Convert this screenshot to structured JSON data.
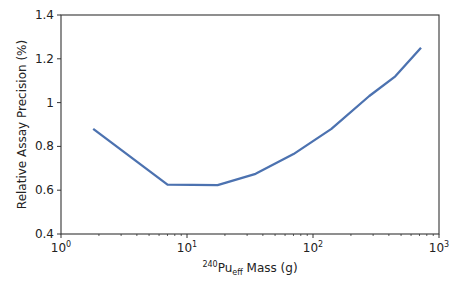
{
  "chart_data": {
    "type": "line",
    "title": "",
    "xlabel": "240Pu_eff Mass (g)",
    "xlabel_parts": {
      "sup": "240",
      "base": "Pu",
      "sub": "eff",
      "rest": " Mass (g)"
    },
    "ylabel": "Relative Assay Precision (%)",
    "xscale": "log",
    "xlim": [
      1,
      1000
    ],
    "ylim": [
      0.4,
      1.4
    ],
    "x_ticks": [
      {
        "base": "10",
        "exp": "0",
        "value": 1
      },
      {
        "base": "10",
        "exp": "1",
        "value": 10
      },
      {
        "base": "10",
        "exp": "2",
        "value": 100
      },
      {
        "base": "10",
        "exp": "3",
        "value": 1000
      }
    ],
    "y_ticks": [
      "0.4",
      "0.6",
      "0.8",
      "1",
      "1.2",
      "1.4"
    ],
    "grid": false,
    "legend": null,
    "series": [
      {
        "name": "precision",
        "color": "#4c72b0",
        "x": [
          1.8,
          7,
          17.5,
          35,
          70,
          140,
          280,
          450,
          720
        ],
        "y": [
          0.88,
          0.625,
          0.623,
          0.675,
          0.765,
          0.88,
          1.03,
          1.12,
          1.25
        ]
      }
    ]
  }
}
